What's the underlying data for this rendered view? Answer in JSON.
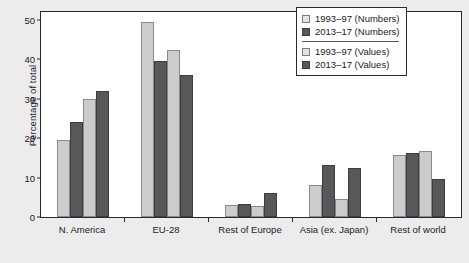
{
  "chart_data": {
    "type": "bar",
    "title": "",
    "subtitle": "",
    "xlabel": "",
    "ylabel": "Percentage of total",
    "ylim": [
      0,
      52
    ],
    "yticks": [
      0,
      10,
      20,
      30,
      40,
      50
    ],
    "ytick_labels": [
      "0",
      "10",
      "20",
      "30",
      "40",
      "50"
    ],
    "grid": false,
    "legend_position": "top-right",
    "categories": [
      "N. America",
      "EU-28",
      "Rest of Europe",
      "Asia (ex. Japan)",
      "Rest of world"
    ],
    "series": [
      {
        "name": "1993–97 (Numbers)",
        "color": "#cccccc",
        "values": [
          19.5,
          49.5,
          3.0,
          8.0,
          15.8
        ]
      },
      {
        "name": "2013–17 (Numbers)",
        "color": "#58585a",
        "values": [
          24.0,
          39.6,
          3.3,
          13.3,
          16.3
        ]
      },
      {
        "name": "1993–97 (Values)",
        "color": "#cccccc",
        "values": [
          29.9,
          42.4,
          2.7,
          4.5,
          16.8
        ]
      },
      {
        "name": "2013–17 (Values)",
        "color": "#58585a",
        "values": [
          32.0,
          36.0,
          6.0,
          12.5,
          9.7
        ]
      }
    ]
  },
  "legend": {
    "items": [
      {
        "label": "1993–97 (Numbers)",
        "swatch": "light"
      },
      {
        "label": "2013–17 (Numbers)",
        "swatch": "dark"
      },
      {
        "label": "1993–97 (Values)",
        "swatch": "light"
      },
      {
        "label": "2013–17 (Values)",
        "swatch": "dark"
      }
    ]
  },
  "colors": {
    "light_bar": "#cccccc",
    "dark_bar": "#58585a",
    "plot_background": "#ffffff",
    "page_background": "#ececed",
    "axis": "#2a2a2a",
    "text": "#1b1b1b"
  }
}
